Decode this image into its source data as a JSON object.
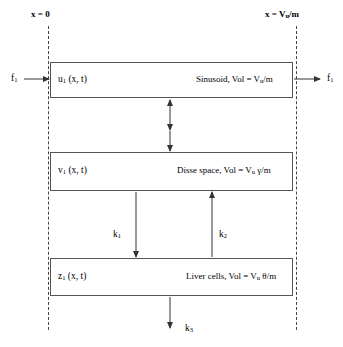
{
  "diagram": {
    "boundaries": {
      "left_label": "x = 0",
      "right_label": "x = V",
      "right_label_sub": "u",
      "right_label_tail": "/m"
    },
    "flows": {
      "inflow_label": "f",
      "inflow_sub": "1",
      "outflow_label": "f",
      "outflow_sub": "1"
    },
    "compartments": [
      {
        "id": "sinusoid",
        "variable": "u",
        "variable_sub": "1",
        "variable_args": " (x, t)",
        "description": "Sinusoid, Vol = V",
        "description_sub": "u",
        "description_tail": "/m"
      },
      {
        "id": "disse-space",
        "variable": "v",
        "variable_sub": "1",
        "variable_args": " (x, t)",
        "description": "Disse space, Vol = V",
        "description_sub": "u",
        "description_tail": " γ/m"
      },
      {
        "id": "liver-cells",
        "variable": "z",
        "variable_sub": "1",
        "variable_args": " (x, t)",
        "description": "Liver cells, Vol = V",
        "description_sub": "u",
        "description_tail": " θ/m"
      }
    ],
    "rates": [
      {
        "id": "k1",
        "label": "k",
        "sub": "1"
      },
      {
        "id": "k2",
        "label": "k",
        "sub": "2"
      },
      {
        "id": "k3",
        "label": "k",
        "sub": "3"
      }
    ],
    "colors": {
      "stroke": "#555555",
      "dashed": "#444444",
      "text": "#000000"
    }
  }
}
